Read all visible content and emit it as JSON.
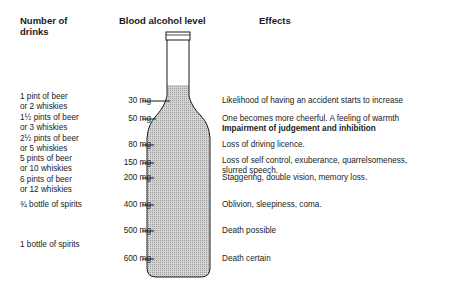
{
  "headers": {
    "drinks": "Number of drinks",
    "drinks_line1": "Number of",
    "drinks_line2": "drinks",
    "level": "Blood alcohol level",
    "effects": "Effects"
  },
  "rows": [
    {
      "drinks_line1": "1 pint of beer",
      "drinks_line2": "or 2 whiskies",
      "level": "30 mg",
      "effect_line1": "Likelihood of having an accident starts to increase",
      "effect_line2": ""
    },
    {
      "drinks_line1": "1½ pints of beer",
      "drinks_line2": "or 3 whiskies",
      "level": "50 mg",
      "effect_line1": "One becomes more cheerful. A feeling of warmth",
      "effect_line2": "Impairment of judgement and inhibition"
    },
    {
      "drinks_line1": "2½ pints of beer",
      "drinks_line2": "or 5 whiskies",
      "level": "80 mg",
      "effect_line1": "Loss of driving licence.",
      "effect_line2": ""
    },
    {
      "drinks_line1": "5 pints of beer",
      "drinks_line2": "or 10 whiskies",
      "level": "150 mg",
      "effect_line1": "Loss of self control, exuberance, quarrelsomeness,",
      "effect_line2": "slurred speech."
    },
    {
      "drinks_line1": "6 pints of beer",
      "drinks_line2": "or 12 whiskies",
      "level": "200 mg",
      "effect_line1": "Staggering, double vision, memory loss.",
      "effect_line2": ""
    },
    {
      "drinks_line1": "¾ bottle of spirits",
      "drinks_line2": "",
      "level": "400 mg",
      "effect_line1": "Oblivion, sleepiness, coma.",
      "effect_line2": ""
    },
    {
      "drinks_line1": "",
      "drinks_line2": "",
      "level": "500 mg",
      "effect_line1": "Death possible",
      "effect_line2": ""
    },
    {
      "drinks_line1": "1 bottle of spirits",
      "drinks_line2": "",
      "level": "600 mg",
      "effect_line1": "Death certain",
      "effect_line2": ""
    }
  ],
  "colors": {
    "liquid": "#c8c8c8",
    "outline": "#1a1a1a"
  }
}
